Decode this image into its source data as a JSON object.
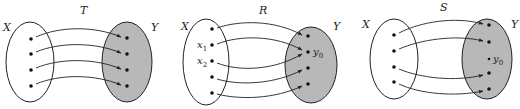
{
  "colors": {
    "codomain_fill": "#b8b8b8",
    "stroke": "#222222",
    "background": "#ffffff"
  },
  "diagrams": [
    {
      "name": "T",
      "title": "T",
      "domain_label": "X",
      "codomain_label": "Y",
      "domain_points": [
        {
          "label": ""
        },
        {
          "label": ""
        },
        {
          "label": ""
        },
        {
          "label": ""
        }
      ],
      "codomain_points": [
        {
          "label": ""
        },
        {
          "label": ""
        },
        {
          "label": ""
        },
        {
          "label": ""
        }
      ],
      "mapping": [
        [
          0,
          0
        ],
        [
          1,
          1
        ],
        [
          2,
          2
        ],
        [
          3,
          3
        ]
      ],
      "description": "one-to-one and onto"
    },
    {
      "name": "R",
      "title": "R",
      "domain_label": "X",
      "codomain_label": "Y",
      "domain_points": [
        {
          "label": ""
        },
        {
          "label": "x1",
          "base": "x",
          "sub": "1"
        },
        {
          "label": "x2",
          "base": "x",
          "sub": "2"
        },
        {
          "label": ""
        },
        {
          "label": ""
        }
      ],
      "codomain_points": [
        {
          "label": ""
        },
        {
          "label": "y0",
          "base": "y",
          "sub": "0"
        },
        {
          "label": ""
        },
        {
          "label": ""
        }
      ],
      "mapping": [
        [
          0,
          0
        ],
        [
          1,
          1
        ],
        [
          2,
          1
        ],
        [
          3,
          2
        ],
        [
          4,
          3
        ]
      ],
      "description": "onto but not one-to-one"
    },
    {
      "name": "S",
      "title": "S",
      "domain_label": "X",
      "codomain_label": "Y",
      "domain_points": [
        {
          "label": ""
        },
        {
          "label": ""
        },
        {
          "label": ""
        },
        {
          "label": ""
        }
      ],
      "codomain_points": [
        {
          "label": ""
        },
        {
          "label": ""
        },
        {
          "label": "y0",
          "base": "y",
          "sub": "0"
        },
        {
          "label": ""
        },
        {
          "label": ""
        }
      ],
      "mapping": [
        [
          0,
          0
        ],
        [
          1,
          1
        ],
        [
          2,
          3
        ],
        [
          3,
          4
        ]
      ],
      "description": "one-to-one but not onto"
    }
  ]
}
